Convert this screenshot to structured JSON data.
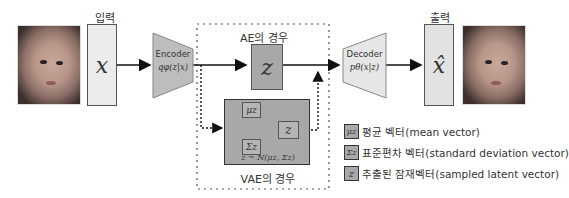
{
  "input": {
    "label": "입력",
    "symbol": "x"
  },
  "encoder": {
    "title": "Encoder",
    "formula": "qφ(z|x)"
  },
  "ae_case": {
    "label": "AE의 경우",
    "symbol": "z"
  },
  "vae_case": {
    "label": "VAE의 경우",
    "mu": "μz",
    "sigma": "Σz",
    "z": "z",
    "sampling": "z ~ N(μz, Σz)"
  },
  "decoder": {
    "title": "Decoder",
    "formula": "pθ(x|z)"
  },
  "output": {
    "label": "출력",
    "symbol": "x̂"
  },
  "legend": [
    {
      "symbol": "μz",
      "text": "평균 벡터(mean vector)"
    },
    {
      "symbol": "Σz",
      "text": "표준편차 벡터(standard deviation vector)"
    },
    {
      "symbol": "z",
      "text": "추출된 잠재벡터(sampled latent vector)"
    }
  ],
  "colors": {
    "box_light": "#ececec",
    "box_dark": "#a8a8a8",
    "trapezoid_encoder": "#bdbdbd",
    "trapezoid_decoder": "#e6e6e6",
    "line": "#111111"
  }
}
